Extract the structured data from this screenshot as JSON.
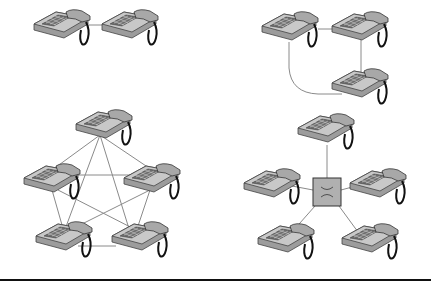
{
  "diagram": {
    "colors": {
      "link": "#8a8a8a",
      "phone_body": "#b8b8b8",
      "phone_dark": "#7a7a7a",
      "cord": "#111111",
      "switch_fill": "#b0b0b0",
      "rule": "#111111"
    },
    "panels": [
      {
        "name": "point-to-point",
        "phones": 2
      },
      {
        "name": "ring-line",
        "phones": 3
      },
      {
        "name": "full-mesh",
        "phones": 5
      },
      {
        "name": "star-switch",
        "phones": 5,
        "center": "switch",
        "switch_symbol": "X"
      }
    ]
  }
}
